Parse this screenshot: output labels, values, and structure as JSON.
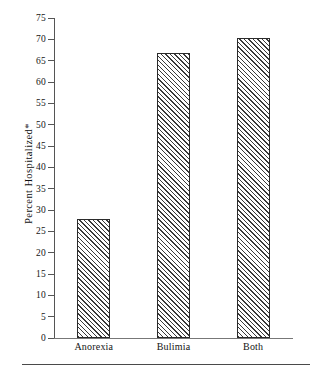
{
  "figure": {
    "background_color": "#ffffff",
    "ink_color": "#1a1a1a",
    "bottom_rule_present": "true"
  },
  "axes": {
    "y_title": "Percent Hospitalized*",
    "y_ticks": [
      "0",
      "5",
      "10",
      "15",
      "20",
      "25",
      "30",
      "35",
      "40",
      "45",
      "50",
      "55",
      "60",
      "65",
      "70",
      "75"
    ],
    "x_categories": [
      "Anorexia",
      "Bulimia",
      "Both"
    ]
  },
  "chart_data": {
    "type": "bar",
    "title": "",
    "subtitle": "",
    "xlabel": "",
    "ylabel": "Percent Hospitalized*",
    "categories": [
      "Anorexia",
      "Bulimia",
      "Both"
    ],
    "values": [
      28,
      66.8,
      70.4
    ],
    "ylim": [
      0,
      75
    ],
    "ytick_step": 5,
    "yticks": [
      0,
      5,
      10,
      15,
      20,
      25,
      30,
      35,
      40,
      45,
      50,
      55,
      60,
      65,
      70,
      75
    ],
    "grid": "off",
    "legend": "none",
    "bar_fill": "diagonal-hatch",
    "bar_edge_color": "#2b2b2b",
    "annotations": [
      "*"
    ]
  }
}
